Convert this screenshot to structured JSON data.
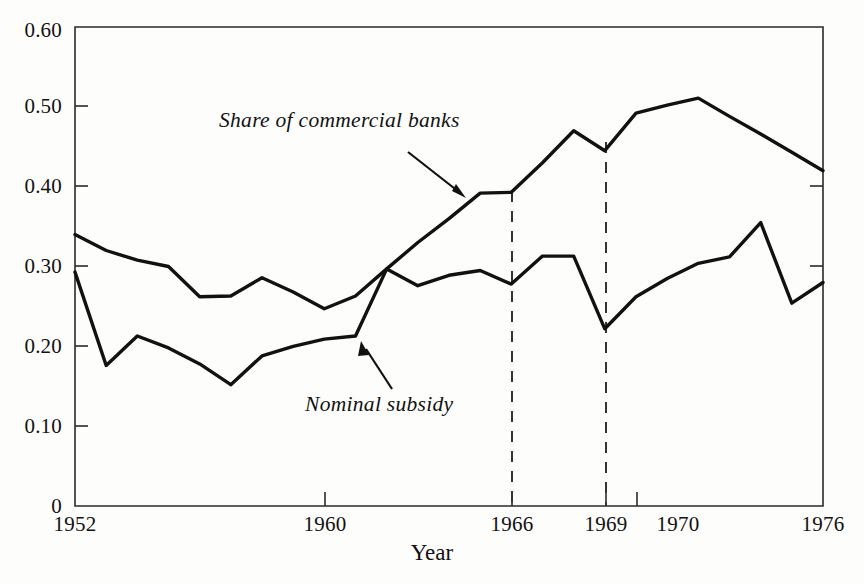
{
  "chart_data": {
    "type": "line",
    "title": "",
    "xlabel": "Year",
    "ylabel": "",
    "xlim": [
      1952,
      1976
    ],
    "ylim": [
      0,
      0.6
    ],
    "grid": false,
    "legend": "inline-annotations",
    "x": [
      1952,
      1953,
      1954,
      1955,
      1956,
      1957,
      1958,
      1959,
      1960,
      1961,
      1962,
      1963,
      1964,
      1965,
      1966,
      1967,
      1968,
      1969,
      1970,
      1971,
      1972,
      1973,
      1974,
      1975,
      1976
    ],
    "series": [
      {
        "name": "Share of commercial banks",
        "values": [
          0.34,
          0.32,
          0.308,
          0.3,
          0.262,
          0.263,
          0.286,
          0.268,
          0.247,
          0.263,
          0.297,
          0.33,
          0.36,
          0.392,
          0.393,
          0.43,
          0.47,
          0.445,
          0.492,
          0.502,
          0.511,
          0.488,
          0.466,
          0.443,
          0.42
        ]
      },
      {
        "name": "Nominal subsidy",
        "values": [
          0.293,
          0.176,
          0.213,
          0.198,
          0.178,
          0.152,
          0.188,
          0.2,
          0.209,
          0.213,
          0.297,
          0.276,
          0.289,
          0.295,
          0.278,
          0.313,
          0.313,
          0.222,
          0.262,
          0.285,
          0.304,
          0.312,
          0.355,
          0.254,
          0.28
        ]
      }
    ],
    "yticks": [
      {
        "value": 0.6,
        "label": "0.60"
      },
      {
        "value": 0.5,
        "label": "0.50"
      },
      {
        "value": 0.4,
        "label": "0.40"
      },
      {
        "value": 0.3,
        "label": "0.30"
      },
      {
        "value": 0.2,
        "label": "0.20"
      },
      {
        "value": 0.1,
        "label": "0.10"
      },
      {
        "value": 0.0,
        "label": "0"
      }
    ],
    "xticks": [
      {
        "value": 1952,
        "label": "1952"
      },
      {
        "value": 1960,
        "label": "1960"
      },
      {
        "value": 1966,
        "label": "1966"
      },
      {
        "value": 1969,
        "label": "1969"
      },
      {
        "value": 1970,
        "label": "1970"
      },
      {
        "value": 1976,
        "label": "1976"
      }
    ],
    "reference_lines": [
      {
        "value": 1966,
        "style": "dashed"
      },
      {
        "value": 1969,
        "style": "dashed"
      }
    ],
    "annotations": [
      {
        "text": "Share of commercial banks",
        "target_x": 1965,
        "target_y": 0.392
      },
      {
        "text": "Nominal subsidy",
        "target_x": 1961.4,
        "target_y": 0.213
      }
    ],
    "colors": {
      "line": "#111111",
      "axis": "#222222",
      "background": "#fdfdfb",
      "reference_line": "#333333"
    }
  },
  "axis": {
    "x_title": "Year"
  }
}
